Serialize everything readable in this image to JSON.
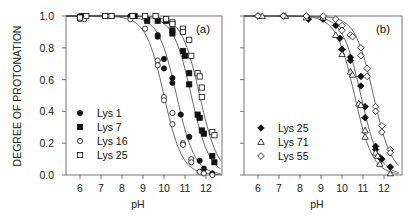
{
  "chart_data": [
    {
      "type": "scatter",
      "panel_label": "(a)",
      "xlabel": "pH",
      "ylabel": "DEGREE OF PROTONATION",
      "xlim": [
        5.3,
        12.7
      ],
      "ylim": [
        0.0,
        1.0
      ],
      "x_ticks": [
        "6",
        "7",
        "8",
        "9",
        "10",
        "11",
        "12"
      ],
      "y_ticks": [
        "0.0",
        "0.2",
        "0.4",
        "0.6",
        "0.8",
        "1.0"
      ],
      "grid": false,
      "legend_position": "lower-left",
      "fit_curves": true,
      "series": [
        {
          "name": "Lys 1",
          "marker": "filled-circle",
          "pKa": 10.6,
          "points": [
            [
              6.0,
              1.0
            ],
            [
              6.2,
              1.0
            ],
            [
              7.3,
              1.0
            ],
            [
              8.4,
              1.0
            ],
            [
              9.2,
              0.98
            ],
            [
              9.7,
              0.88
            ],
            [
              9.7,
              0.87
            ],
            [
              10.0,
              0.73
            ],
            [
              10.0,
              0.67
            ],
            [
              10.4,
              0.61
            ],
            [
              10.4,
              0.58
            ],
            [
              10.8,
              0.38
            ],
            [
              11.2,
              0.24
            ],
            [
              11.7,
              0.09
            ],
            [
              11.9,
              0.04
            ],
            [
              12.3,
              0.01
            ]
          ]
        },
        {
          "name": "Lys 7",
          "marker": "filled-square",
          "pKa": 11.3,
          "points": [
            [
              6.2,
              1.0
            ],
            [
              7.5,
              1.0
            ],
            [
              8.6,
              1.0
            ],
            [
              9.2,
              0.97
            ],
            [
              9.7,
              0.97
            ],
            [
              10.1,
              0.97
            ],
            [
              10.4,
              0.91
            ],
            [
              10.4,
              0.89
            ],
            [
              10.9,
              0.78
            ],
            [
              11.0,
              0.75
            ],
            [
              11.2,
              0.64
            ],
            [
              11.2,
              0.57
            ],
            [
              11.6,
              0.38
            ],
            [
              11.7,
              0.36
            ],
            [
              11.8,
              0.28
            ],
            [
              11.9,
              0.26
            ],
            [
              12.3,
              0.12
            ],
            [
              12.4,
              0.08
            ]
          ]
        },
        {
          "name": "Lys 16",
          "marker": "open-circle",
          "pKa": 10.0,
          "points": [
            [
              6.0,
              0.98
            ],
            [
              6.2,
              0.98
            ],
            [
              7.3,
              1.0
            ],
            [
              8.4,
              0.98
            ],
            [
              9.1,
              0.92
            ],
            [
              9.7,
              0.72
            ],
            [
              9.7,
              0.69
            ],
            [
              10.0,
              0.49
            ],
            [
              10.0,
              0.47
            ],
            [
              10.4,
              0.39
            ],
            [
              10.4,
              0.32
            ],
            [
              10.9,
              0.2
            ],
            [
              10.9,
              0.19
            ],
            [
              11.3,
              0.1
            ],
            [
              11.3,
              0.08
            ],
            [
              11.7,
              0.02
            ],
            [
              11.9,
              0.01
            ],
            [
              12.3,
              0.0
            ]
          ]
        },
        {
          "name": "Lys 25",
          "marker": "open-square",
          "pKa": 11.7,
          "points": [
            [
              6.0,
              0.99
            ],
            [
              6.3,
              1.0
            ],
            [
              7.2,
              1.0
            ],
            [
              7.5,
              1.0
            ],
            [
              8.5,
              1.0
            ],
            [
              9.1,
              1.0
            ],
            [
              9.6,
              1.0
            ],
            [
              10.1,
              0.98
            ],
            [
              10.4,
              0.96
            ],
            [
              10.4,
              0.95
            ],
            [
              10.9,
              0.92
            ],
            [
              10.9,
              0.9
            ],
            [
              11.2,
              0.85
            ],
            [
              11.3,
              0.75
            ],
            [
              11.6,
              0.64
            ],
            [
              11.7,
              0.62
            ],
            [
              11.8,
              0.55
            ],
            [
              11.8,
              0.49
            ],
            [
              12.3,
              0.27
            ],
            [
              12.4,
              0.25
            ]
          ]
        }
      ]
    },
    {
      "type": "scatter",
      "panel_label": "(b)",
      "xlabel": "pH",
      "ylabel": "",
      "xlim": [
        5.3,
        12.7
      ],
      "ylim": [
        0.0,
        1.0
      ],
      "x_ticks": [
        "6",
        "7",
        "8",
        "9",
        "10",
        "11",
        "12"
      ],
      "grid": false,
      "legend_position": "lower-left",
      "fit_curves": true,
      "series": [
        {
          "name": "Lys 25",
          "marker": "filled-diamond",
          "pKa": 10.9,
          "points": [
            [
              6.0,
              1.0
            ],
            [
              7.2,
              1.0
            ],
            [
              8.3,
              1.0
            ],
            [
              8.4,
              0.98
            ],
            [
              9.1,
              0.98
            ],
            [
              9.7,
              0.94
            ],
            [
              9.9,
              0.86
            ],
            [
              10.0,
              0.79
            ],
            [
              10.4,
              0.74
            ],
            [
              10.4,
              0.72
            ],
            [
              10.9,
              0.62
            ],
            [
              10.9,
              0.56
            ],
            [
              11.1,
              0.43
            ],
            [
              11.1,
              0.36
            ],
            [
              11.6,
              0.18
            ],
            [
              11.6,
              0.16
            ],
            [
              11.8,
              0.11
            ],
            [
              11.9,
              0.1
            ],
            [
              12.3,
              0.05
            ]
          ]
        },
        {
          "name": "Lys 71",
          "marker": "open-triangle",
          "pKa": 10.6,
          "points": [
            [
              6.2,
              1.0
            ],
            [
              7.3,
              1.0
            ],
            [
              8.3,
              0.99
            ],
            [
              9.1,
              0.99
            ],
            [
              9.7,
              0.88
            ],
            [
              10.0,
              0.76
            ],
            [
              10.4,
              0.65
            ],
            [
              10.5,
              0.63
            ],
            [
              10.8,
              0.45
            ],
            [
              10.9,
              0.44
            ],
            [
              11.1,
              0.28
            ],
            [
              11.1,
              0.24
            ],
            [
              11.6,
              0.14
            ],
            [
              11.7,
              0.12
            ],
            [
              11.8,
              0.07
            ],
            [
              12.3,
              0.01
            ]
          ]
        },
        {
          "name": "Lys 55",
          "marker": "open-diamond",
          "pKa": 11.5,
          "points": [
            [
              6.0,
              1.0
            ],
            [
              7.2,
              1.0
            ],
            [
              8.3,
              1.0
            ],
            [
              9.1,
              1.0
            ],
            [
              9.7,
              0.98
            ],
            [
              10.0,
              0.94
            ],
            [
              10.0,
              0.91
            ],
            [
              10.4,
              0.88
            ],
            [
              10.5,
              0.87
            ],
            [
              10.9,
              0.8
            ],
            [
              10.9,
              0.75
            ],
            [
              11.2,
              0.67
            ],
            [
              11.2,
              0.62
            ],
            [
              11.6,
              0.43
            ],
            [
              11.6,
              0.4
            ],
            [
              11.9,
              0.31
            ],
            [
              11.9,
              0.27
            ],
            [
              12.3,
              0.16
            ],
            [
              12.3,
              0.14
            ]
          ]
        }
      ]
    }
  ]
}
